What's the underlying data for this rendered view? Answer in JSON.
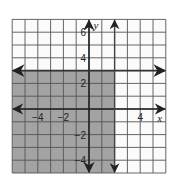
{
  "chart_data": {
    "type": "inequality-graph",
    "title": "",
    "xlabel": "x",
    "ylabel": "y",
    "xlim": [
      -6,
      6
    ],
    "ylim": [
      -5,
      7
    ],
    "grid": true,
    "grid_step": 1,
    "x_tick_labels": [
      {
        "value": -4,
        "label": "−4"
      },
      {
        "value": -2,
        "label": "−2"
      },
      {
        "value": 4,
        "label": "4"
      }
    ],
    "y_tick_labels": [
      {
        "value": 6,
        "label": "6"
      },
      {
        "value": 4,
        "label": "4"
      },
      {
        "value": 2,
        "label": "2"
      },
      {
        "value": -2,
        "label": "−2"
      },
      {
        "value": -4,
        "label": "−4"
      }
    ],
    "boundary_lines": [
      {
        "orientation": "horizontal",
        "equation": "y = 3",
        "value": 3,
        "style": "solid",
        "arrows": "both"
      },
      {
        "orientation": "vertical",
        "equation": "x = 2",
        "value": 2,
        "style": "solid",
        "arrows": "both"
      }
    ],
    "shaded_region": {
      "description": "x < 2 and y < 3",
      "x_range": [
        -6,
        2
      ],
      "y_range": [
        -5,
        3
      ],
      "color": "#a3a3a3"
    },
    "colors": {
      "background": "#ffffff",
      "grid_bg": "#fbfbfb",
      "grid_line": "#555555",
      "shade": "#a3a3a3",
      "axis": "#222222"
    }
  }
}
